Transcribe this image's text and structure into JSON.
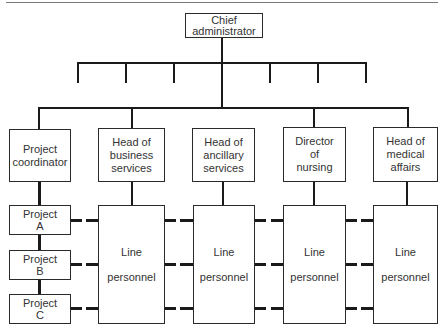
{
  "chart": {
    "top": {
      "line1": "Chief",
      "line2": "administrator"
    },
    "heads": [
      {
        "line1": "Project",
        "line2": "coordinator",
        "line3": ""
      },
      {
        "line1": "Head of",
        "line2": "business",
        "line3": "services"
      },
      {
        "line1": "Head of",
        "line2": "ancillary",
        "line3": "services"
      },
      {
        "line1": "Director",
        "line2": "of",
        "line3": "nursing"
      },
      {
        "line1": "Head of",
        "line2": "medical",
        "line3": "affairs"
      }
    ],
    "projects": [
      {
        "line1": "Project",
        "line2": "A"
      },
      {
        "line1": "Project",
        "line2": "B"
      },
      {
        "line1": "Project",
        "line2": "C"
      }
    ],
    "line_personnel": [
      {
        "line1": "Line",
        "line2": "personnel"
      },
      {
        "line1": "Line",
        "line2": "personnel"
      },
      {
        "line1": "Line",
        "line2": "personnel"
      },
      {
        "line1": "Line",
        "line2": "personnel"
      }
    ],
    "comb_drops": 6
  }
}
